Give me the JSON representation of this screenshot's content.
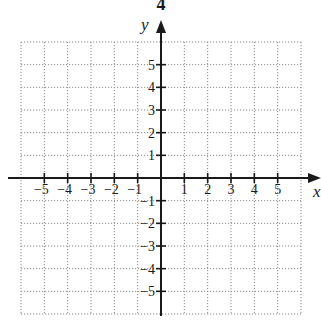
{
  "figure": {
    "top_label": "4"
  },
  "chart_data": {
    "type": "scatter",
    "title": "",
    "subtitle": "",
    "xlabel": "x",
    "ylabel": "y",
    "xlim": [
      -6,
      6
    ],
    "ylim": [
      -6,
      6
    ],
    "grid": true,
    "grid_style": "dotted",
    "x_ticks": [
      -5,
      -4,
      -3,
      -2,
      -1,
      1,
      2,
      3,
      4,
      5
    ],
    "y_ticks": [
      -5,
      -4,
      -3,
      -2,
      -1,
      1,
      2,
      3,
      4,
      5
    ],
    "x_tick_labels": [
      "−5",
      "−4",
      "−3",
      "−2",
      "−1",
      "1",
      "2",
      "3",
      "4",
      "5"
    ],
    "y_tick_labels": [
      "−5",
      "−4",
      "−3",
      "−2",
      "−1",
      "1",
      "2",
      "3",
      "4",
      "5"
    ],
    "series": [],
    "legend": null,
    "annotations": []
  },
  "colors": {
    "axis": "#1a1a1a",
    "grid": "#8a8a8a",
    "background": "#ffffff"
  }
}
